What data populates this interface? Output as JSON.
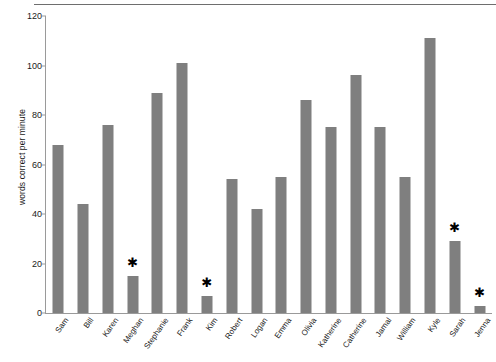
{
  "chart_data": {
    "type": "bar",
    "title": "",
    "xlabel": "",
    "ylabel": "words correct per minute",
    "ylim": [
      0,
      120
    ],
    "yticks": [
      0,
      20,
      40,
      60,
      80,
      100,
      120
    ],
    "grid": false,
    "legend": false,
    "bar_color": "#7f7f7f",
    "annotation_marker": "✱",
    "annotation_note": "Asterisk marks students below benchmark",
    "categories": [
      "Sam",
      "Bill",
      "Karen",
      "Meghan",
      "Stephanie",
      "Frank",
      "Kim",
      "Robert",
      "Logan",
      "Emma",
      "Olivia",
      "Katherine",
      "Catherine",
      "Jamal",
      "William",
      "Kyle",
      "Sarah",
      "Jenna"
    ],
    "values": [
      68,
      44,
      76,
      15,
      89,
      101,
      7,
      54,
      42,
      55,
      86,
      75,
      96,
      75,
      55,
      111,
      29,
      3
    ],
    "annotated": [
      "Meghan",
      "Kim",
      "Sarah",
      "Jenna"
    ],
    "series": [
      {
        "name": "words correct per minute",
        "values": [
          68,
          44,
          76,
          15,
          89,
          101,
          7,
          54,
          42,
          55,
          86,
          75,
          96,
          75,
          55,
          111,
          29,
          3
        ]
      }
    ]
  }
}
